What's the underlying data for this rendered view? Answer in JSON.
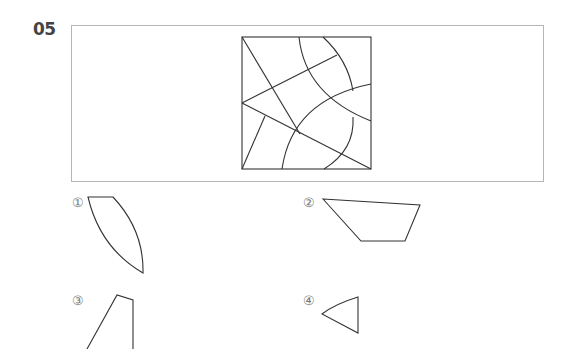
{
  "question": {
    "number": "05"
  },
  "options": [
    {
      "label": "①",
      "shape": "curved-lens-piece"
    },
    {
      "label": "②",
      "shape": "trapezoid-piece"
    },
    {
      "label": "③",
      "shape": "quadrilateral-piece"
    },
    {
      "label": "④",
      "shape": "curved-triangle-piece"
    }
  ],
  "colors": {
    "stroke": "#333333",
    "frame": "#b5b5b5",
    "label": "#777777"
  }
}
